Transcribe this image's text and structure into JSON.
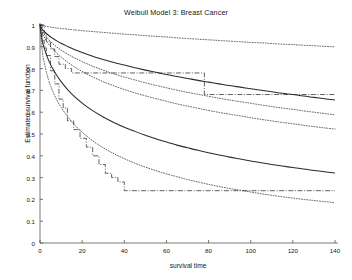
{
  "chart_data": {
    "type": "line",
    "title": "Weibull Model 3: Breast Cancer",
    "xlabel": "survival time",
    "ylabel": "Estimated survival function",
    "xlim": [
      0,
      140
    ],
    "ylim": [
      0,
      1
    ],
    "xticks": [
      0,
      20,
      40,
      60,
      80,
      100,
      120,
      140
    ],
    "yticks": [
      0,
      0.1,
      0.2,
      0.3,
      0.4,
      0.5,
      0.6,
      0.7,
      0.8,
      0.9,
      1
    ],
    "xtick_labels": [
      "0",
      "20",
      "40",
      "60",
      "80",
      "100",
      "120",
      "140"
    ],
    "ytick_labels": [
      "0",
      "0.1",
      "0.2",
      "0.3",
      "0.4",
      "0.5",
      "0.6",
      "0.7",
      "0.8",
      "0.9",
      "1"
    ],
    "grid": false,
    "legend": "none",
    "line_color": "#2b2b2b",
    "series": [
      {
        "name": "Weibull fit group 1",
        "style": "solid",
        "x": [
          0,
          1,
          2,
          4,
          6,
          8,
          10,
          13,
          16,
          20,
          25,
          30,
          35,
          40,
          45,
          50,
          55,
          60,
          65,
          70,
          75,
          80,
          85,
          90,
          95,
          100,
          105,
          110,
          115,
          120,
          125,
          130,
          135,
          140
        ],
        "values": [
          1.0,
          0.982,
          0.971,
          0.953,
          0.939,
          0.927,
          0.916,
          0.902,
          0.889,
          0.874,
          0.857,
          0.842,
          0.828,
          0.816,
          0.804,
          0.793,
          0.783,
          0.773,
          0.764,
          0.755,
          0.746,
          0.738,
          0.73,
          0.722,
          0.715,
          0.708,
          0.701,
          0.694,
          0.687,
          0.681,
          0.674,
          0.668,
          0.662,
          0.656
        ]
      },
      {
        "name": "Weibull fit group 1 upper CI",
        "style": "dotted",
        "x": [
          0,
          1,
          2,
          4,
          6,
          8,
          10,
          13,
          16,
          20,
          25,
          30,
          35,
          40,
          45,
          50,
          55,
          60,
          65,
          70,
          75,
          80,
          85,
          90,
          95,
          100,
          105,
          110,
          115,
          120,
          125,
          130,
          135,
          140
        ],
        "values": [
          1.0,
          0.997,
          0.995,
          0.992,
          0.989,
          0.986,
          0.984,
          0.981,
          0.978,
          0.974,
          0.97,
          0.966,
          0.962,
          0.958,
          0.955,
          0.951,
          0.948,
          0.945,
          0.941,
          0.938,
          0.935,
          0.932,
          0.929,
          0.926,
          0.923,
          0.92,
          0.918,
          0.915,
          0.912,
          0.91,
          0.907,
          0.905,
          0.902,
          0.9
        ]
      },
      {
        "name": "Weibull fit group 1 lower CI",
        "style": "dotted",
        "x": [
          0,
          1,
          2,
          4,
          6,
          8,
          10,
          13,
          16,
          20,
          25,
          30,
          35,
          40,
          45,
          50,
          55,
          60,
          65,
          70,
          75,
          80,
          85,
          90,
          95,
          100,
          105,
          110,
          115,
          120,
          125,
          130,
          135,
          140
        ],
        "values": [
          1.0,
          0.974,
          0.958,
          0.934,
          0.915,
          0.899,
          0.885,
          0.867,
          0.851,
          0.832,
          0.811,
          0.793,
          0.776,
          0.761,
          0.748,
          0.735,
          0.723,
          0.712,
          0.701,
          0.691,
          0.682,
          0.673,
          0.664,
          0.656,
          0.648,
          0.641,
          0.633,
          0.626,
          0.619,
          0.613,
          0.606,
          0.6,
          0.594,
          0.588
        ]
      },
      {
        "name": "Kaplan-Meier group 1",
        "style": "dashdot-step",
        "x": [
          0,
          2,
          3,
          5,
          7,
          9,
          12,
          15,
          78,
          140
        ],
        "values": [
          1.0,
          0.962,
          0.925,
          0.89,
          0.855,
          0.82,
          0.8,
          0.78,
          0.681,
          0.681
        ]
      },
      {
        "name": "Weibull fit group 2",
        "style": "solid",
        "x": [
          0,
          1,
          2,
          4,
          6,
          8,
          10,
          13,
          16,
          20,
          25,
          30,
          35,
          40,
          45,
          50,
          55,
          60,
          65,
          70,
          75,
          80,
          85,
          90,
          95,
          100,
          105,
          110,
          115,
          120,
          125,
          130,
          135,
          140
        ],
        "values": [
          1.0,
          0.932,
          0.894,
          0.84,
          0.8,
          0.768,
          0.74,
          0.705,
          0.675,
          0.642,
          0.607,
          0.578,
          0.553,
          0.531,
          0.512,
          0.494,
          0.478,
          0.463,
          0.449,
          0.437,
          0.425,
          0.414,
          0.404,
          0.394,
          0.385,
          0.376,
          0.368,
          0.36,
          0.353,
          0.346,
          0.339,
          0.333,
          0.327,
          0.321
        ]
      },
      {
        "name": "Weibull fit group 2 upper CI",
        "style": "dotted",
        "x": [
          0,
          1,
          2,
          4,
          6,
          8,
          10,
          13,
          16,
          20,
          25,
          30,
          35,
          40,
          45,
          50,
          55,
          60,
          65,
          70,
          75,
          80,
          85,
          90,
          95,
          100,
          105,
          110,
          115,
          120,
          125,
          130,
          135,
          140
        ],
        "values": [
          1.0,
          0.966,
          0.945,
          0.914,
          0.89,
          0.87,
          0.853,
          0.83,
          0.81,
          0.787,
          0.762,
          0.74,
          0.721,
          0.704,
          0.689,
          0.675,
          0.662,
          0.65,
          0.638,
          0.628,
          0.618,
          0.608,
          0.599,
          0.591,
          0.583,
          0.575,
          0.567,
          0.56,
          0.553,
          0.547,
          0.54,
          0.534,
          0.528,
          0.523
        ]
      },
      {
        "name": "Weibull fit group 2 lower CI",
        "style": "dotted",
        "x": [
          0,
          1,
          2,
          4,
          6,
          8,
          10,
          13,
          16,
          20,
          25,
          30,
          35,
          40,
          45,
          50,
          55,
          60,
          65,
          70,
          75,
          80,
          85,
          90,
          95,
          100,
          105,
          110,
          115,
          120,
          125,
          130,
          135,
          140
        ],
        "values": [
          1.0,
          0.887,
          0.827,
          0.75,
          0.697,
          0.656,
          0.622,
          0.581,
          0.546,
          0.508,
          0.469,
          0.437,
          0.41,
          0.387,
          0.366,
          0.348,
          0.332,
          0.317,
          0.304,
          0.291,
          0.28,
          0.269,
          0.259,
          0.25,
          0.242,
          0.234,
          0.226,
          0.219,
          0.212,
          0.206,
          0.2,
          0.195,
          0.19,
          0.185
        ]
      },
      {
        "name": "Kaplan-Meier group 2",
        "style": "dashdot-step",
        "x": [
          0,
          1,
          2,
          3,
          5,
          7,
          9,
          11,
          13,
          16,
          19,
          22,
          25,
          28,
          31,
          34,
          37,
          40,
          90,
          140
        ],
        "values": [
          1.0,
          0.93,
          0.895,
          0.86,
          0.79,
          0.73,
          0.66,
          0.62,
          0.56,
          0.52,
          0.48,
          0.44,
          0.4,
          0.36,
          0.32,
          0.3,
          0.28,
          0.24,
          0.24,
          0.24
        ]
      }
    ]
  }
}
